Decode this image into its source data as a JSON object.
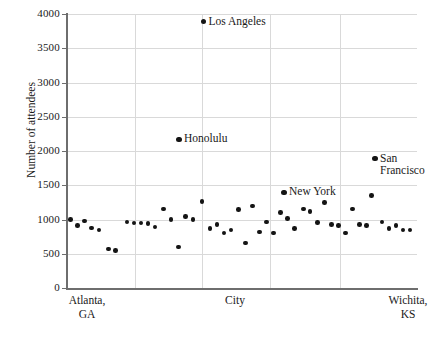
{
  "chart_data": {
    "type": "scatter",
    "title": "",
    "xlabel": "City",
    "ylabel": "Number of attendees",
    "ylim": [
      0,
      4000
    ],
    "ytick_labels": [
      "4000",
      "3500",
      "3000",
      "2500",
      "2000",
      "1500",
      "1000",
      "500",
      "0"
    ],
    "ytick_values": [
      4000,
      3500,
      3000,
      2500,
      2000,
      1500,
      1000,
      500,
      0
    ],
    "xtick_labels": [
      "Atlanta,\nGA",
      "City",
      "Wichita,\nKS"
    ],
    "x_axis_left_label": "Atlanta,\nGA",
    "x_axis_center_label": "City",
    "x_axis_right_label": "Wichita,\nKS",
    "grid": "both",
    "legend": "none",
    "point_color": "#141414",
    "grid_color": "#d9d9d9",
    "axis_color": "#6e6e6e",
    "annotations": [
      {
        "label": "Los Angeles",
        "x": 39,
        "y": 3890
      },
      {
        "label": "Honolulu",
        "x": 32,
        "y": 2170
      },
      {
        "label": "New York",
        "x": 62,
        "y": 1400
      },
      {
        "label": "San Francisco",
        "x": 88,
        "y": 1885
      }
    ],
    "points": [
      {
        "x": 1.0,
        "y": 1000
      },
      {
        "x": 3.0,
        "y": 915
      },
      {
        "x": 5.0,
        "y": 975
      },
      {
        "x": 7.0,
        "y": 875
      },
      {
        "x": 9.2,
        "y": 845
      },
      {
        "x": 11.8,
        "y": 570
      },
      {
        "x": 13.9,
        "y": 545
      },
      {
        "x": 17.2,
        "y": 965
      },
      {
        "x": 19.2,
        "y": 950
      },
      {
        "x": 21.2,
        "y": 950
      },
      {
        "x": 23.2,
        "y": 940
      },
      {
        "x": 25.2,
        "y": 890
      },
      {
        "x": 27.5,
        "y": 1150
      },
      {
        "x": 29.7,
        "y": 1000
      },
      {
        "x": 31.8,
        "y": 600
      },
      {
        "x": 33.8,
        "y": 1045
      },
      {
        "x": 36.0,
        "y": 1000
      },
      {
        "x": 38.5,
        "y": 1265
      },
      {
        "x": 40.8,
        "y": 870
      },
      {
        "x": 42.8,
        "y": 925
      },
      {
        "x": 44.8,
        "y": 800
      },
      {
        "x": 46.8,
        "y": 845
      },
      {
        "x": 49.0,
        "y": 1145
      },
      {
        "x": 51.0,
        "y": 655
      },
      {
        "x": 53.0,
        "y": 1195
      },
      {
        "x": 55.0,
        "y": 820
      },
      {
        "x": 57.0,
        "y": 960
      },
      {
        "x": 59.0,
        "y": 805
      },
      {
        "x": 61.0,
        "y": 1105
      },
      {
        "x": 63.0,
        "y": 1015
      },
      {
        "x": 65.0,
        "y": 870
      },
      {
        "x": 67.5,
        "y": 1150
      },
      {
        "x": 69.5,
        "y": 1120
      },
      {
        "x": 71.5,
        "y": 955
      },
      {
        "x": 73.5,
        "y": 1245
      },
      {
        "x": 75.5,
        "y": 930
      },
      {
        "x": 77.5,
        "y": 915
      },
      {
        "x": 79.5,
        "y": 805
      },
      {
        "x": 81.5,
        "y": 1150
      },
      {
        "x": 83.5,
        "y": 925
      },
      {
        "x": 85.5,
        "y": 910
      },
      {
        "x": 87.0,
        "y": 1350
      },
      {
        "x": 90.0,
        "y": 965
      },
      {
        "x": 92.0,
        "y": 870
      },
      {
        "x": 94.0,
        "y": 915
      },
      {
        "x": 96.0,
        "y": 850
      },
      {
        "x": 98.0,
        "y": 845
      }
    ]
  },
  "axis": {
    "y_title": "Number of attendees",
    "x_left": "Atlanta,\nGA",
    "x_center": "City",
    "x_right": "Wichita,\nKS"
  }
}
